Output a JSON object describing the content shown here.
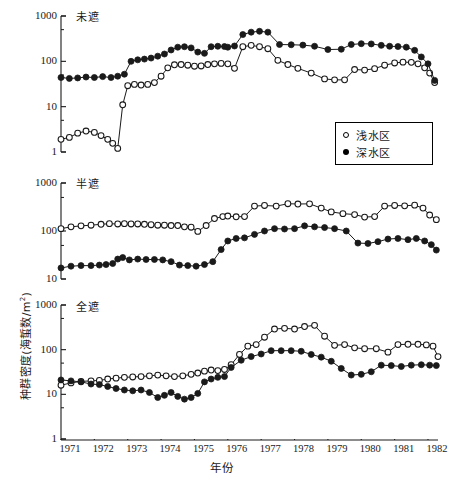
{
  "figure": {
    "xaxis_title": "年份",
    "yaxis_title_main": "种群密度(海蜇数/m",
    "yaxis_title_sup": "2",
    "yaxis_title_tail": ")",
    "yaxis_title_full": "种群密度(海蜇数/m2)"
  },
  "legend": {
    "entries": [
      {
        "marker": "open-circle",
        "label": "浅水区"
      },
      {
        "marker": "filled-circle",
        "label": "深水区"
      }
    ]
  },
  "xticks": [
    "1971",
    "1972",
    "1973",
    "1974",
    "1975",
    "1976",
    "1977",
    "1978",
    "1979",
    "1980",
    "1981",
    "1982"
  ],
  "panels": [
    {
      "title": "未遮",
      "yticks": [
        "1000",
        "100",
        "10",
        "1"
      ]
    },
    {
      "title": "半遮",
      "yticks": [
        "1000",
        "100",
        "10"
      ]
    },
    {
      "title": "全遮",
      "yticks": [
        "1000",
        "100",
        "10",
        "1"
      ]
    }
  ],
  "chart_data": [
    {
      "type": "line",
      "title": "未遮",
      "xlabel": "年份",
      "ylabel": "种群密度(海蜇数/m2)",
      "yscale": "log",
      "ylim": [
        1,
        1000
      ],
      "xlim": [
        1971.0,
        1982.3
      ],
      "grid": false,
      "legend_position": "inside-right",
      "series": [
        {
          "name": "浅水区",
          "marker": "open-circle",
          "x": [
            1971.0,
            1971.25,
            1971.5,
            1971.75,
            1972.0,
            1972.2,
            1972.4,
            1972.55,
            1972.7,
            1972.85,
            1973.0,
            1973.2,
            1973.4,
            1973.6,
            1973.8,
            1974.0,
            1974.2,
            1974.4,
            1974.6,
            1974.8,
            1975.0,
            1975.2,
            1975.4,
            1975.6,
            1975.8,
            1976.0,
            1976.2,
            1976.45,
            1976.7,
            1976.95,
            1977.2,
            1977.5,
            1977.8,
            1978.1,
            1978.5,
            1978.9,
            1979.2,
            1979.5,
            1979.8,
            1980.1,
            1980.4,
            1980.7,
            1981.0,
            1981.25,
            1981.5,
            1981.7,
            1981.9,
            1982.05,
            1982.2
          ],
          "y": [
            1.9,
            2.1,
            2.6,
            2.9,
            2.7,
            2.3,
            1.9,
            1.55,
            1.2,
            11.0,
            29.0,
            31.0,
            30.0,
            31.0,
            34.0,
            47.0,
            72.0,
            84.0,
            85.0,
            82.0,
            78.0,
            79.0,
            85.0,
            88.0,
            90.0,
            88.0,
            70.0,
            210.0,
            225.0,
            210.0,
            190.0,
            105.0,
            85.0,
            70.0,
            55.0,
            41.0,
            39.0,
            39.0,
            66.0,
            64.0,
            69.0,
            82.0,
            92.0,
            96.0,
            95.0,
            88.0,
            72.0,
            55.0,
            34.0
          ]
        },
        {
          "name": "深水区",
          "marker": "filled-circle",
          "x": [
            1971.0,
            1971.25,
            1971.5,
            1971.75,
            1972.0,
            1972.25,
            1972.5,
            1972.7,
            1972.9,
            1973.1,
            1973.3,
            1973.5,
            1973.7,
            1973.9,
            1974.1,
            1974.3,
            1974.5,
            1974.7,
            1974.9,
            1975.1,
            1975.3,
            1975.5,
            1975.7,
            1975.9,
            1976.0,
            1976.2,
            1976.45,
            1976.7,
            1976.95,
            1977.2,
            1977.55,
            1977.9,
            1978.25,
            1978.6,
            1979.0,
            1979.4,
            1979.7,
            1980.0,
            1980.3,
            1980.6,
            1980.85,
            1981.1,
            1981.35,
            1981.6,
            1981.8,
            1982.0,
            1982.2
          ],
          "y": [
            44.0,
            42.0,
            43.0,
            45.0,
            44.0,
            46.0,
            44.0,
            47.0,
            52.0,
            100.0,
            108.0,
            112.0,
            118.0,
            130.0,
            145.0,
            178.0,
            205.0,
            210.0,
            198.0,
            160.0,
            150.0,
            210.0,
            215.0,
            212.0,
            205.0,
            218.0,
            390.0,
            440.0,
            460.0,
            440.0,
            235.0,
            232.0,
            228.0,
            215.0,
            182.0,
            185.0,
            235.0,
            245.0,
            242.0,
            225.0,
            215.0,
            212.0,
            205.0,
            175.0,
            125.0,
            88.0,
            38.0
          ]
        }
      ]
    },
    {
      "type": "line",
      "title": "半遮",
      "xlabel": "年份",
      "ylabel": "种群密度(海蜇数/m2)",
      "yscale": "log",
      "ylim": [
        10,
        1000
      ],
      "xlim": [
        1971.0,
        1982.3
      ],
      "grid": false,
      "series": [
        {
          "name": "浅水区",
          "marker": "open-circle",
          "x": [
            1971.0,
            1971.3,
            1971.6,
            1971.9,
            1972.2,
            1972.45,
            1972.7,
            1972.9,
            1973.1,
            1973.3,
            1973.5,
            1973.7,
            1973.9,
            1974.1,
            1974.3,
            1974.5,
            1974.7,
            1974.9,
            1975.1,
            1975.35,
            1975.6,
            1975.85,
            1976.0,
            1976.25,
            1976.5,
            1976.8,
            1977.1,
            1977.45,
            1977.8,
            1978.1,
            1978.45,
            1978.8,
            1979.1,
            1979.45,
            1979.8,
            1980.1,
            1980.4,
            1980.7,
            1981.0,
            1981.3,
            1981.6,
            1981.85,
            1982.05,
            1982.25
          ],
          "y": [
            112.0,
            122.0,
            128.0,
            132.0,
            138.0,
            142.0,
            140.0,
            142.0,
            140.0,
            140.0,
            138.0,
            135.0,
            132.0,
            132.0,
            130.0,
            130.0,
            122.0,
            120.0,
            98.0,
            130.0,
            182.0,
            200.0,
            205.0,
            198.0,
            200.0,
            330.0,
            340.0,
            330.0,
            370.0,
            365.0,
            368.0,
            300.0,
            250.0,
            230.0,
            220.0,
            195.0,
            200.0,
            330.0,
            340.0,
            335.0,
            345.0,
            300.0,
            215.0,
            172.0
          ]
        },
        {
          "name": "深水区",
          "marker": "filled-circle",
          "x": [
            1971.0,
            1971.3,
            1971.6,
            1971.9,
            1972.15,
            1972.35,
            1972.55,
            1972.7,
            1972.85,
            1973.05,
            1973.3,
            1973.55,
            1973.8,
            1974.05,
            1974.3,
            1974.55,
            1974.8,
            1975.05,
            1975.3,
            1975.55,
            1975.8,
            1976.0,
            1976.25,
            1976.5,
            1976.8,
            1977.1,
            1977.4,
            1977.7,
            1978.0,
            1978.3,
            1978.6,
            1978.9,
            1979.2,
            1979.55,
            1979.9,
            1980.2,
            1980.5,
            1980.8,
            1981.1,
            1981.4,
            1981.65,
            1981.9,
            1982.1,
            1982.25
          ],
          "y": [
            17.0,
            18.5,
            19.0,
            19.0,
            19.5,
            20.0,
            21.0,
            26.0,
            28.0,
            25.0,
            26.0,
            25.5,
            25.5,
            25.0,
            23.0,
            19.5,
            19.0,
            18.5,
            20.0,
            23.0,
            41.0,
            62.0,
            70.0,
            72.0,
            85.0,
            100.0,
            112.0,
            110.0,
            112.0,
            128.0,
            122.0,
            118.0,
            112.0,
            100.0,
            56.0,
            55.0,
            60.0,
            68.0,
            70.0,
            66.0,
            70.0,
            62.0,
            52.0,
            40.0
          ]
        }
      ]
    },
    {
      "type": "line",
      "title": "全遮",
      "xlabel": "年份",
      "ylabel": "种群密度(海蜇数/m2)",
      "yscale": "log",
      "ylim": [
        1,
        1000
      ],
      "xlim": [
        1971.0,
        1982.3
      ],
      "grid": false,
      "series": [
        {
          "name": "浅水区",
          "marker": "open-circle",
          "x": [
            1971.0,
            1971.3,
            1971.6,
            1971.9,
            1972.15,
            1972.4,
            1972.65,
            1972.9,
            1973.15,
            1973.4,
            1973.65,
            1973.9,
            1974.15,
            1974.4,
            1974.65,
            1974.9,
            1975.1,
            1975.3,
            1975.5,
            1975.7,
            1975.9,
            1976.1,
            1976.35,
            1976.6,
            1976.85,
            1977.1,
            1977.4,
            1977.7,
            1978.0,
            1978.3,
            1978.6,
            1978.9,
            1979.2,
            1979.5,
            1979.8,
            1980.1,
            1980.45,
            1980.8,
            1981.1,
            1981.4,
            1981.7,
            1981.95,
            1982.15,
            1982.3
          ],
          "y": [
            16.0,
            18.0,
            19.5,
            20.0,
            20.5,
            22.0,
            23.0,
            24.0,
            24.5,
            25.0,
            26.0,
            27.0,
            26.0,
            25.0,
            26.0,
            28.0,
            30.0,
            33.0,
            35.0,
            34.0,
            36.0,
            46.0,
            78.0,
            120.0,
            130.0,
            190.0,
            290.0,
            300.0,
            290.0,
            330.0,
            350.0,
            200.0,
            125.0,
            130.0,
            110.0,
            105.0,
            105.0,
            88.0,
            130.0,
            132.0,
            132.0,
            128.0,
            120.0,
            70.0
          ]
        },
        {
          "name": "深水区",
          "marker": "filled-circle",
          "x": [
            1971.0,
            1971.3,
            1971.6,
            1971.9,
            1972.15,
            1972.4,
            1972.65,
            1972.9,
            1973.15,
            1973.4,
            1973.65,
            1973.9,
            1974.1,
            1974.3,
            1974.5,
            1974.7,
            1974.9,
            1975.1,
            1975.3,
            1975.5,
            1975.7,
            1975.9,
            1976.1,
            1976.4,
            1976.7,
            1977.0,
            1977.3,
            1977.6,
            1977.9,
            1978.2,
            1978.5,
            1978.8,
            1979.1,
            1979.4,
            1979.7,
            1980.0,
            1980.3,
            1980.6,
            1980.9,
            1981.2,
            1981.5,
            1981.8,
            1982.05,
            1982.25
          ],
          "y": [
            21.0,
            20.0,
            19.0,
            17.0,
            16.5,
            15.0,
            13.5,
            12.5,
            12.0,
            12.5,
            11.0,
            8.5,
            9.5,
            11.0,
            9.0,
            7.8,
            8.5,
            10.5,
            19.0,
            22.0,
            24.0,
            25.0,
            40.0,
            58.0,
            70.0,
            80.0,
            95.0,
            95.0,
            95.0,
            92.0,
            78.0,
            68.0,
            55.0,
            38.0,
            27.0,
            28.0,
            32.0,
            45.0,
            44.0,
            42.0,
            45.0,
            46.0,
            45.0,
            44.0
          ]
        }
      ]
    }
  ]
}
